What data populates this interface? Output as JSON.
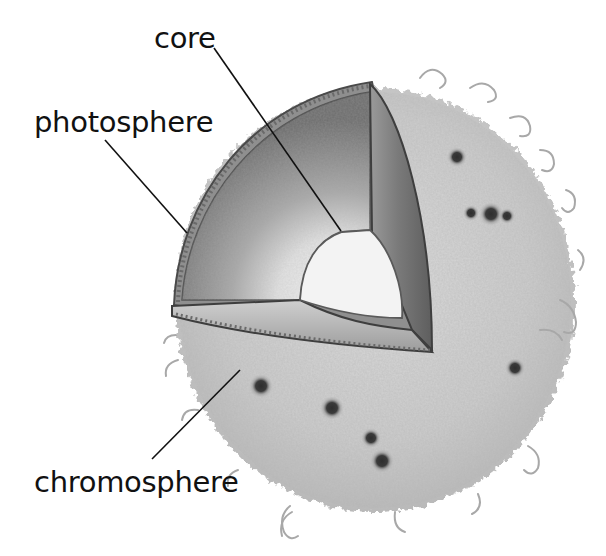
{
  "diagram": {
    "labels": [
      {
        "id": "core",
        "text": "core",
        "x": 154,
        "y": 32
      },
      {
        "id": "photosphere",
        "text": "photosphere",
        "x": 34,
        "y": 116
      },
      {
        "id": "chromosphere",
        "text": "chromosphere",
        "x": 34,
        "y": 478
      }
    ],
    "leader_lines": [
      {
        "label": "core",
        "from": [
          214,
          48
        ],
        "to": [
          341,
          231
        ]
      },
      {
        "label": "photosphere",
        "from": [
          105,
          140
        ],
        "to": [
          187,
          233
        ]
      },
      {
        "label": "chromosphere",
        "from": [
          152,
          459
        ],
        "to": [
          240,
          370
        ]
      }
    ],
    "colors": {
      "background": "#ffffff",
      "chromosphere_fill": "#cfcfcf",
      "chromosphere_texture": "#a9a9a9",
      "photosphere_dark": "#7d7d7d",
      "photosphere_mid": "#b5b5b5",
      "core_fill": "#f2f2f2",
      "outline": "#4a4a4a",
      "sunspot": "#2e2e2e",
      "text": "#111111"
    },
    "sunspots": [
      {
        "x": 457,
        "y": 157,
        "r": 4
      },
      {
        "x": 471,
        "y": 213,
        "r": 3
      },
      {
        "x": 491,
        "y": 214,
        "r": 5
      },
      {
        "x": 507,
        "y": 216,
        "r": 3
      },
      {
        "x": 261,
        "y": 386,
        "r": 5
      },
      {
        "x": 332,
        "y": 408,
        "r": 5
      },
      {
        "x": 371,
        "y": 438,
        "r": 4
      },
      {
        "x": 382,
        "y": 461,
        "r": 5
      },
      {
        "x": 515,
        "y": 368,
        "r": 4
      }
    ]
  }
}
